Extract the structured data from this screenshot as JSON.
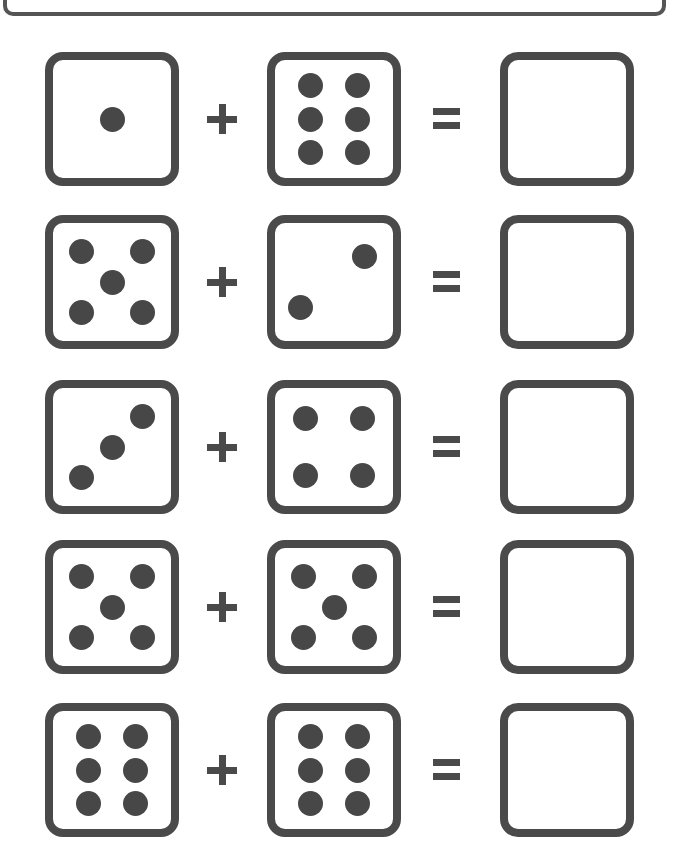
{
  "worksheet": {
    "type": "dice-addition",
    "operator_plus": "+",
    "operator_equals": "=",
    "colors": {
      "stroke": "#4a4a4a",
      "dot": "#474747",
      "background": "#ffffff"
    },
    "rows": [
      {
        "top": 52,
        "die1": 1,
        "die2": 6,
        "answer": ""
      },
      {
        "top": 215,
        "die1": 5,
        "die2": 2,
        "answer": ""
      },
      {
        "top": 380,
        "die1": 3,
        "die2": 4,
        "answer": ""
      },
      {
        "top": 540,
        "die1": 5,
        "die2": 5,
        "answer": ""
      },
      {
        "top": 703,
        "die1": 6,
        "die2": 6,
        "answer": ""
      }
    ]
  },
  "pip_layouts": {
    "1": [
      [
        50,
        50
      ]
    ],
    "2": [
      [
        76,
        28
      ],
      [
        22,
        72
      ]
    ],
    "3": [
      [
        76,
        24
      ],
      [
        50,
        50
      ],
      [
        24,
        76
      ]
    ],
    "4": [
      [
        26,
        26
      ],
      [
        74,
        26
      ],
      [
        26,
        74
      ],
      [
        74,
        74
      ]
    ],
    "5": [
      [
        24,
        24
      ],
      [
        76,
        24
      ],
      [
        50,
        50
      ],
      [
        24,
        76
      ],
      [
        76,
        76
      ]
    ],
    "6": [
      [
        30,
        22
      ],
      [
        70,
        22
      ],
      [
        30,
        50
      ],
      [
        70,
        50
      ],
      [
        30,
        78
      ],
      [
        70,
        78
      ]
    ]
  }
}
